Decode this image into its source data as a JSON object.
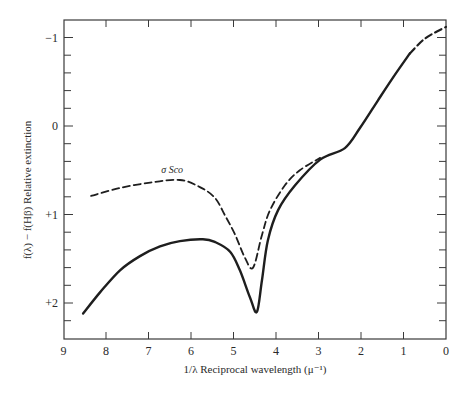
{
  "chart_data": {
    "type": "line",
    "title": "",
    "xlabel": "1/λ Reciprocal wavelength (μ⁻¹)",
    "ylabel": "f(λ) − f(Hβ) Relative extinction",
    "xlim": [
      9,
      0
    ],
    "ylim": [
      2.4,
      -1.2
    ],
    "x_inverted": true,
    "y_inverted": true,
    "grid": false,
    "x_ticks": [
      9,
      8,
      7,
      6,
      5,
      4,
      3,
      2,
      1,
      0
    ],
    "x_tick_labels": [
      "9",
      "8",
      "7",
      "6",
      "5",
      "4",
      "3",
      "2",
      "1",
      "0"
    ],
    "y_ticks": [
      -1,
      0,
      1,
      2
    ],
    "y_tick_labels": [
      "−1",
      "0",
      "+1",
      "+2"
    ],
    "y_minor_tick_step": 0.2,
    "series": [
      {
        "name": "Average interstellar extinction",
        "style": "solid",
        "points": [
          [
            8.54,
            2.12
          ],
          [
            8.14,
            1.88
          ],
          [
            7.67,
            1.63
          ],
          [
            7.2,
            1.47
          ],
          [
            6.73,
            1.36
          ],
          [
            6.26,
            1.3
          ],
          [
            5.72,
            1.28
          ],
          [
            5.44,
            1.31
          ],
          [
            5.08,
            1.42
          ],
          [
            4.85,
            1.63
          ],
          [
            4.61,
            1.94
          ],
          [
            4.45,
            2.1
          ],
          [
            4.33,
            1.74
          ],
          [
            4.19,
            1.29
          ],
          [
            3.95,
            0.95
          ],
          [
            3.55,
            0.67
          ],
          [
            2.96,
            0.38
          ],
          [
            2.38,
            0.25
          ],
          [
            2.02,
            0.02
          ],
          [
            1.6,
            -0.29
          ],
          [
            1.2,
            -0.58
          ],
          [
            0.85,
            -0.82
          ]
        ],
        "extrapolated_dashed_points": [
          [
            0.85,
            -0.82
          ],
          [
            0.49,
            -0.99
          ],
          [
            0.0,
            -1.12
          ]
        ]
      },
      {
        "name": "σ Sco",
        "style": "dashed",
        "points": [
          [
            8.35,
            0.79
          ],
          [
            7.67,
            0.7
          ],
          [
            6.96,
            0.64
          ],
          [
            6.26,
            0.61
          ],
          [
            5.79,
            0.69
          ],
          [
            5.44,
            0.81
          ],
          [
            5.2,
            1.01
          ],
          [
            4.96,
            1.23
          ],
          [
            4.73,
            1.49
          ],
          [
            4.54,
            1.6
          ],
          [
            4.33,
            1.23
          ],
          [
            4.14,
            0.95
          ],
          [
            3.79,
            0.67
          ],
          [
            3.44,
            0.5
          ],
          [
            2.96,
            0.36
          ]
        ]
      }
    ],
    "annotations": [
      {
        "text": "σ Sco",
        "x": 6.7,
        "y": 0.53
      }
    ],
    "legend": "none"
  },
  "colors": {
    "line": "#1e1e1e",
    "axis": "#3a3a3a",
    "background": "#ffffff"
  }
}
